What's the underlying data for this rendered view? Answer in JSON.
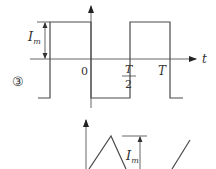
{
  "figure": {
    "label": "③",
    "top_plot": {
      "axis_label": "t",
      "amplitude_label": "I",
      "amplitude_sub": "m",
      "origin_label": "0",
      "half_period_num": "T",
      "half_period_den": "2",
      "period_label": "T",
      "waveform": "square"
    },
    "bottom_plot": {
      "amplitude_label": "I",
      "amplitude_sub": "m",
      "waveform": "triangle"
    }
  }
}
